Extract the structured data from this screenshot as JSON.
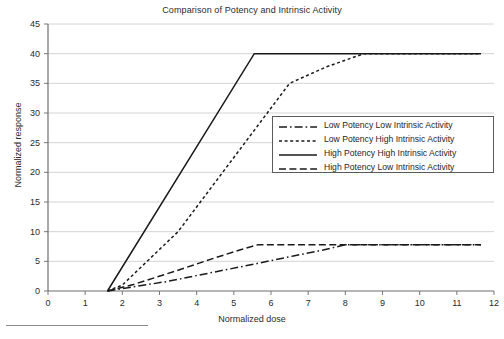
{
  "chart_data": {
    "type": "line",
    "title": "Comparison of Potency and Intrinsic Activity",
    "xlabel": "Normalized dose",
    "ylabel": "Normalized response",
    "xlim": [
      0,
      12
    ],
    "ylim": [
      0,
      45
    ],
    "xticks": [
      0,
      1,
      2,
      3,
      4,
      5,
      6,
      7,
      8,
      9,
      10,
      11,
      12
    ],
    "yticks": [
      0,
      5,
      10,
      15,
      20,
      25,
      30,
      35,
      40,
      45
    ],
    "grid": "horizontal",
    "legend_position": "center-right",
    "series": [
      {
        "name": "Low Potency Low Intrinsic Activity",
        "style": "dash-dot",
        "color": "#1a1a1a",
        "x": [
          1.6,
          2.2,
          3.2,
          4.4,
          5.6,
          6.6,
          7.4,
          8.0,
          11.65
        ],
        "y": [
          0.0,
          0.6,
          1.6,
          3.1,
          4.6,
          5.9,
          6.9,
          7.8,
          7.8
        ]
      },
      {
        "name": "Low Potency High Intrinsic Activity",
        "style": "dashed-fine",
        "color": "#1a1a1a",
        "x": [
          1.6,
          2.0,
          3.5,
          5.0,
          6.5,
          7.5,
          8.5,
          11.65
        ],
        "y": [
          0.0,
          1.0,
          10.0,
          22.5,
          35.0,
          37.8,
          40.0,
          40.0
        ]
      },
      {
        "name": "High Potency High Intrinsic Activity",
        "style": "solid",
        "color": "#1a1a1a",
        "x": [
          1.6,
          5.55,
          11.65
        ],
        "y": [
          0.0,
          40.0,
          40.0
        ]
      },
      {
        "name": "High Potency Low Intrinsic Activity",
        "style": "dashed-long",
        "color": "#1a1a1a",
        "x": [
          1.6,
          2.3,
          3.4,
          4.5,
          5.2,
          5.65,
          11.65
        ],
        "y": [
          0.0,
          1.1,
          3.3,
          5.6,
          7.0,
          7.8,
          7.8
        ]
      }
    ]
  },
  "legend": {
    "items": [
      {
        "label": "Low Potency Low Intrinsic Activity",
        "sample": "dash-dot-sample"
      },
      {
        "label": "Low Potency High Intrinsic Activity",
        "sample": "dashed-fine-sample"
      },
      {
        "label": "High Potency High Intrinsic Activity",
        "sample": "solid-sample"
      },
      {
        "label": "High Potency Low Intrinsic Activity",
        "sample": "dashed-long-sample"
      }
    ]
  }
}
